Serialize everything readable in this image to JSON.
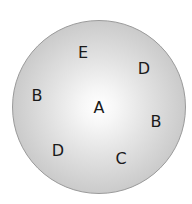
{
  "diagram": {
    "shape": "circle",
    "center": [
      99,
      107
    ],
    "diameter": 174,
    "colors": {
      "center_fill": "#ffffff",
      "edge_fill": "#b8b8b8",
      "outline": "#9a9a9a",
      "text": "#1a1a1a"
    },
    "labels": [
      {
        "text": "E",
        "x": 83,
        "y": 53
      },
      {
        "text": "D",
        "x": 144,
        "y": 69
      },
      {
        "text": "B",
        "x": 37,
        "y": 96
      },
      {
        "text": "A",
        "x": 99,
        "y": 108
      },
      {
        "text": "B",
        "x": 156,
        "y": 122
      },
      {
        "text": "D",
        "x": 58,
        "y": 151
      },
      {
        "text": "C",
        "x": 121,
        "y": 159
      }
    ]
  }
}
